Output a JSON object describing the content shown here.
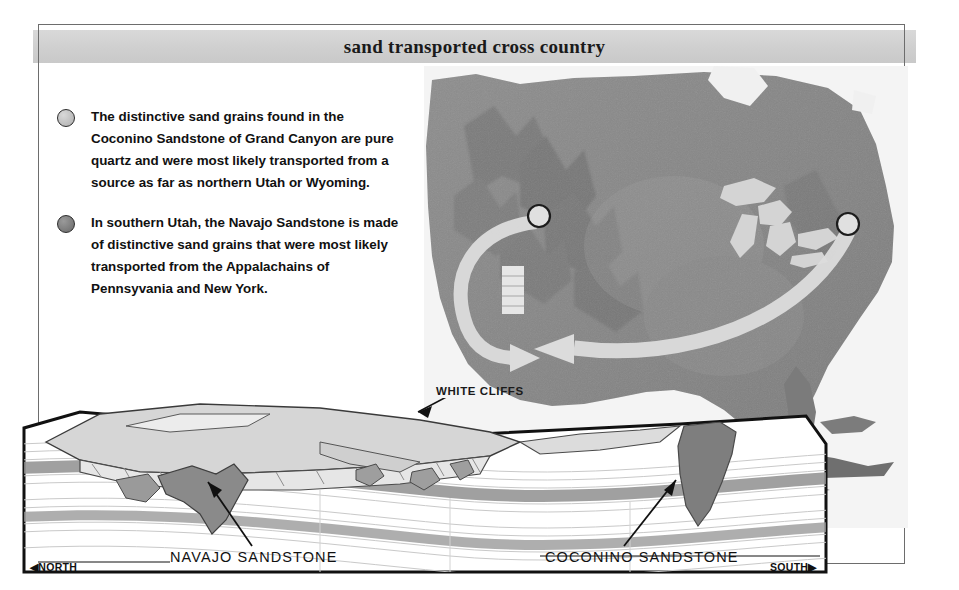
{
  "figure": {
    "title": "sand transported cross country"
  },
  "legend": {
    "items": [
      {
        "marker": "light-circle-marker",
        "text": "The distinctive sand grains found in the Coconino Sandstone of Grand Canyon are pure quartz and were most likely transported from a source as far as northern Utah or Wyoming."
      },
      {
        "marker": "dark-circle-marker",
        "text": "In southern Utah, the Navajo Sandstone is made of distinctive sand grains that were most likely transported from the Appalachains of Pennsyvania and New York."
      }
    ]
  },
  "map": {
    "description": "satellite relief map of the United States",
    "source_markers": [
      {
        "name": "northern-utah-wyoming-marker",
        "x": 115,
        "y": 150
      },
      {
        "name": "appalachian-marker",
        "x": 424,
        "y": 158
      }
    ],
    "deposition_target": {
      "name": "deposition-target-zone",
      "x": 86,
      "y": 222
    },
    "arrows": [
      {
        "name": "arrow-from-utah-wyoming"
      },
      {
        "name": "arrow-from-appalachians"
      }
    ]
  },
  "block_diagram": {
    "annotations": {
      "white_cliffs": "WHITE CLIFFS",
      "navajo": "NAVAJO SANDSTONE",
      "coconino": "COCONINO SANDSTONE"
    },
    "directions": {
      "north": "NORTH",
      "south": "SOUTH"
    }
  },
  "colors": {
    "frame": "#6d6d6d",
    "title_band": "#d2d2d2",
    "block_border": "#111111",
    "navajo_band": "#8f8f8f",
    "coconino_band": "#9a9a9a",
    "map_land": "#8a8a8a",
    "arrow": "#d8d8d8"
  }
}
